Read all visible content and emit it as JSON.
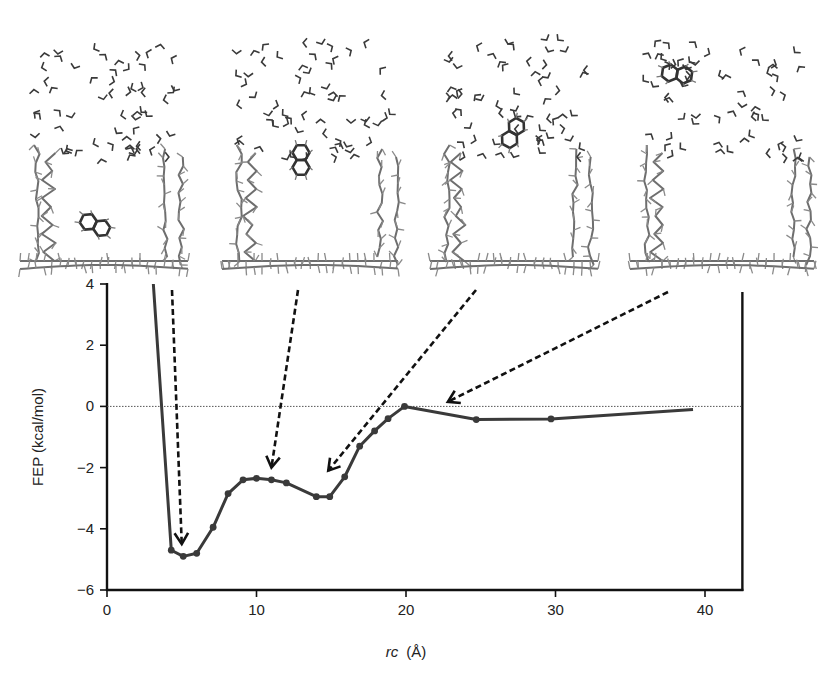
{
  "chart_data": {
    "type": "line",
    "title": "",
    "xlabel": "rc (Å)",
    "xlabel_italic_part": "rc",
    "xlabel_unit": "(Å)",
    "ylabel": "FEP (kcal/mol)",
    "xlim": [
      0,
      42.5
    ],
    "ylim": [
      -6,
      4
    ],
    "xticks": [
      0,
      10,
      20,
      30,
      40
    ],
    "yticks": [
      4,
      2,
      0,
      -2,
      -4,
      -6
    ],
    "xtick_labels": [
      "0",
      "10",
      "20",
      "30",
      "40"
    ],
    "ytick_labels": [
      "4",
      "2",
      "0",
      "−2",
      "−4",
      "−6"
    ],
    "grid": false,
    "reference_line": {
      "y": 0,
      "style": "dotted"
    },
    "series": [
      {
        "name": "FEP",
        "x": [
          3.1,
          4.3,
          5.1,
          6.0,
          7.1,
          8.1,
          9.1,
          10.0,
          11.0,
          12.0,
          14.0,
          14.9,
          15.9,
          16.9,
          17.9,
          18.8,
          19.9,
          24.7,
          29.7,
          39.2
        ],
        "values": [
          4.0,
          -4.7,
          -4.9,
          -4.8,
          -3.95,
          -2.85,
          -2.4,
          -2.35,
          -2.4,
          -2.5,
          -2.95,
          -2.95,
          -2.3,
          -1.3,
          -0.8,
          -0.4,
          0.0,
          -0.43,
          -0.41,
          -0.1
        ],
        "markers": [
          false,
          true,
          true,
          true,
          true,
          true,
          true,
          true,
          true,
          true,
          true,
          true,
          true,
          true,
          true,
          true,
          true,
          true,
          true,
          false
        ]
      }
    ],
    "annotations": [
      {
        "type": "dashed-arrow",
        "from_panel": 1,
        "to": {
          "x": 5.0,
          "y": -4.5
        },
        "label": ""
      },
      {
        "type": "dashed-arrow",
        "from_panel": 2,
        "to": {
          "x": 11.0,
          "y": -2.0
        },
        "label": ""
      },
      {
        "type": "dashed-arrow",
        "from_panel": 3,
        "to": {
          "x": 14.8,
          "y": -2.1
        },
        "label": ""
      },
      {
        "type": "dashed-arrow",
        "from_panel": 4,
        "to": {
          "x": 22.8,
          "y": 0.15
        },
        "label": ""
      }
    ],
    "inset_images": [
      {
        "name": "snapshot-bound-deep",
        "description": "naphthalene lying inside cavity near floor",
        "ligand_position": "inside-bottom"
      },
      {
        "name": "snapshot-bound-upright",
        "description": "naphthalene upright inside cavity",
        "ligand_position": "inside-middle"
      },
      {
        "name": "snapshot-cavity-entrance",
        "description": "naphthalene at cavity entrance",
        "ligand_position": "entrance"
      },
      {
        "name": "snapshot-unbound",
        "description": "naphthalene in bulk water above cavity",
        "ligand_position": "bulk"
      }
    ]
  },
  "style": {
    "line_color": "#3a3a3a",
    "axis_color": "#111111",
    "arrow_color": "#111111",
    "molecule_color": "#6e6e6e",
    "water_color": "#3a3a3a",
    "ligand_color": "#333333"
  }
}
